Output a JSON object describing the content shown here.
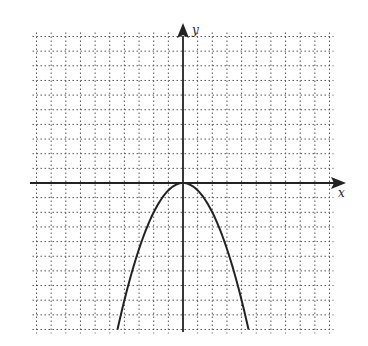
{
  "chart_data": {
    "type": "line",
    "title": "",
    "xlabel": "x",
    "ylabel": "y",
    "xlim": [
      -10,
      10
    ],
    "ylim": [
      -10,
      10
    ],
    "grid": true,
    "grid_style": "dotted",
    "tick_labels": "none",
    "series": [
      {
        "name": "parabola",
        "equation": "y = -0.5x^2",
        "vertex": [
          0,
          0
        ],
        "opens": "down",
        "x": [
          -4.5,
          -4,
          -3,
          -2,
          -1,
          0,
          1,
          2,
          3,
          4,
          4.5
        ],
        "values": [
          -10.1,
          -8,
          -4.5,
          -2,
          -0.5,
          0,
          -0.5,
          -2,
          -4.5,
          -8,
          -10.1
        ]
      }
    ]
  },
  "axes": {
    "x_label": "x",
    "y_label": "y"
  },
  "colors": {
    "curve": "#222222",
    "axis": "#222222",
    "grid": "#555555"
  }
}
